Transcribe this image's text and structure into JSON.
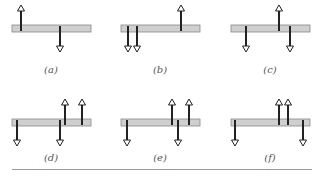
{
  "figure": {
    "colors": {
      "beam_fill": "#cfcfcf",
      "beam_stroke": "#888888",
      "arrow": "#222222"
    },
    "panels": [
      {
        "label": "(a)",
        "beam": {
          "x": 12,
          "y": 25,
          "w": 79,
          "h": 7
        },
        "arrows": [
          {
            "x": 21,
            "dir": "up"
          },
          {
            "x": 60,
            "dir": "down"
          }
        ]
      },
      {
        "label": "(b)",
        "beam": {
          "x": 121,
          "y": 25,
          "w": 79,
          "h": 7
        },
        "arrows": [
          {
            "x": 128,
            "dir": "down"
          },
          {
            "x": 137,
            "dir": "down"
          },
          {
            "x": 181,
            "dir": "up"
          }
        ]
      },
      {
        "label": "(c)",
        "beam": {
          "x": 231,
          "y": 25,
          "w": 79,
          "h": 7
        },
        "arrows": [
          {
            "x": 246,
            "dir": "down"
          },
          {
            "x": 279,
            "dir": "up"
          },
          {
            "x": 290,
            "dir": "down"
          }
        ]
      },
      {
        "label": "(d)",
        "beam": {
          "x": 12,
          "y": 119,
          "w": 79,
          "h": 7
        },
        "arrows": [
          {
            "x": 17,
            "dir": "down"
          },
          {
            "x": 60,
            "dir": "down"
          },
          {
            "x": 65,
            "dir": "up"
          },
          {
            "x": 82,
            "dir": "up"
          }
        ]
      },
      {
        "label": "(e)",
        "beam": {
          "x": 121,
          "y": 119,
          "w": 79,
          "h": 7
        },
        "arrows": [
          {
            "x": 127,
            "dir": "down"
          },
          {
            "x": 172,
            "dir": "up"
          },
          {
            "x": 178,
            "dir": "down"
          },
          {
            "x": 189,
            "dir": "up"
          }
        ]
      },
      {
        "label": "(f)",
        "beam": {
          "x": 231,
          "y": 119,
          "w": 79,
          "h": 7
        },
        "arrows": [
          {
            "x": 235,
            "dir": "down"
          },
          {
            "x": 279,
            "dir": "up"
          },
          {
            "x": 288,
            "dir": "up"
          },
          {
            "x": 303,
            "dir": "down"
          }
        ]
      }
    ],
    "label_positions": [
      {
        "x": 31,
        "y": 64
      },
      {
        "x": 140,
        "y": 64
      },
      {
        "x": 250,
        "y": 64
      },
      {
        "x": 31,
        "y": 152
      },
      {
        "x": 140,
        "y": 152
      },
      {
        "x": 250,
        "y": 152
      }
    ]
  }
}
